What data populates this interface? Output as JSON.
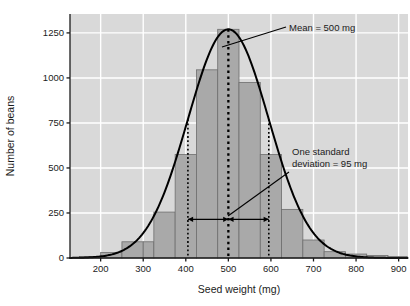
{
  "chart_data": {
    "type": "bar",
    "title": "",
    "subtitle": "",
    "xlabel": "Seed weight (mg)",
    "ylabel": "Number of beans",
    "xlim": [
      128,
      922
    ],
    "ylim": [
      0,
      1355
    ],
    "grid": true,
    "legend": null,
    "bin_width": 50,
    "categories": [
      "150-200",
      "200-250",
      "250-300",
      "300-325",
      "325-375",
      "375-425",
      "425-475",
      "475-525",
      "525-575",
      "575-625",
      "625-675",
      "675-725",
      "725-775",
      "775-825",
      "825-875",
      "875-920"
    ],
    "bin_edges": [
      150,
      200,
      250,
      300,
      325,
      375,
      425,
      475,
      525,
      575,
      625,
      675,
      725,
      775,
      825,
      875,
      920
    ],
    "values": [
      8,
      30,
      90,
      90,
      255,
      575,
      1045,
      1270,
      975,
      575,
      270,
      100,
      35,
      22,
      14,
      8
    ],
    "x_ticks": [
      200,
      300,
      400,
      500,
      600,
      700,
      800,
      900
    ],
    "x_tick_labels": [
      "200",
      "300",
      "400",
      "500",
      "600",
      "700",
      "800",
      "900"
    ],
    "y_ticks": [
      0,
      250,
      500,
      750,
      1000,
      1250
    ],
    "y_tick_labels": [
      "0",
      "250",
      "500",
      "750",
      "1000",
      "1250"
    ],
    "overlay_curve": {
      "type": "normal",
      "mean": 500,
      "sd": 95,
      "peak_value": 1270,
      "color": "#000000"
    },
    "markers": {
      "mean_line_x": 500,
      "sd_line_low_x": 405,
      "sd_line_high_x": 595,
      "arrow_y_value": 215
    },
    "annotations": [
      {
        "name": "mean-annotation",
        "text": "Mean = 500 mg",
        "lines": [
          "Mean = 500 mg"
        ]
      },
      {
        "name": "sd-annotation",
        "text": "One standard deviation = 95 mg",
        "lines": [
          "One standard",
          "deviation = 95 mg"
        ]
      }
    ],
    "colors": {
      "plot_background": "#d9d9d9",
      "gridline": "#ffffff",
      "bar_fill": "#a9a9a9",
      "bar_stroke": "#6e6e6e",
      "curve": "#000000",
      "axis": "#1b1b1b",
      "dotted_line": "#000000",
      "text": "#1b1b1b",
      "page_background": "#ffffff"
    }
  }
}
